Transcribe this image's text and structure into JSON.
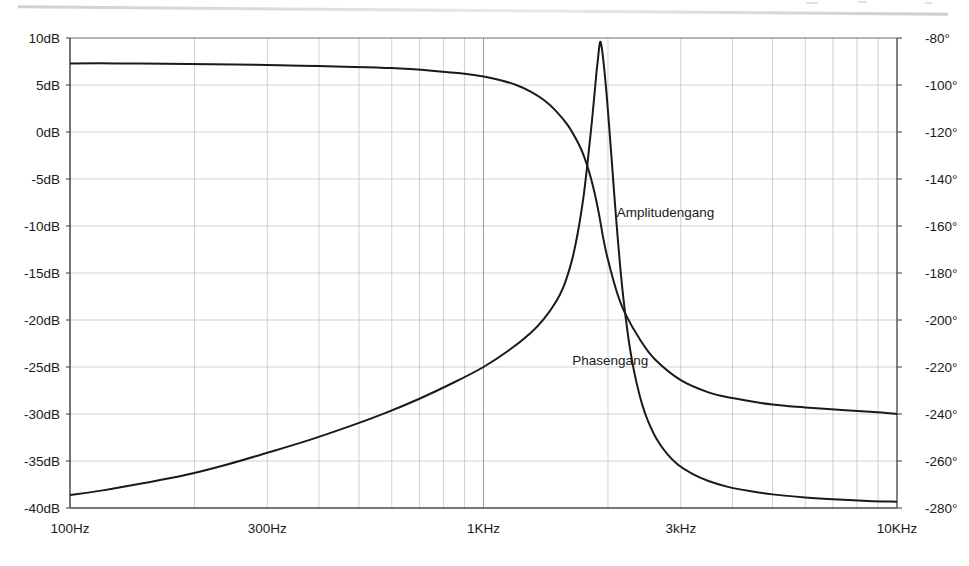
{
  "figure": {
    "title": "",
    "background": "#ffffff",
    "ink_color": "#1a1a1a",
    "grid_color": "#8f9bb0",
    "axis_color": "#4a4a4a"
  },
  "chart_data": {
    "type": "line",
    "title": "",
    "xlabel": "",
    "ylabel": "",
    "xscale": "log",
    "grid": true,
    "legend_position": "inline-annotation",
    "xlim": [
      100,
      10000
    ],
    "xtick_labels": [
      "100Hz",
      "300Hz",
      "1KHz",
      "3kHz",
      "10KHz"
    ],
    "xtick_values": [
      100,
      300,
      1000,
      3000,
      10000
    ],
    "axes": [
      {
        "id": "left",
        "label": "",
        "unit": "dB",
        "lim": [
          -40,
          10
        ],
        "step": 5,
        "tick_labels": [
          "10dB",
          "5dB",
          "0dB",
          "-5dB",
          "-10dB",
          "-15dB",
          "-20dB",
          "-25dB",
          "-30dB",
          "-35dB",
          "-40dB"
        ],
        "tick_values": [
          10,
          5,
          0,
          -5,
          -10,
          -15,
          -20,
          -25,
          -30,
          -35,
          -40
        ]
      },
      {
        "id": "right",
        "label": "",
        "unit": "deg",
        "lim": [
          -280,
          -80
        ],
        "step": 20,
        "tick_labels": [
          "-80°",
          "-100°",
          "-120°",
          "-140°",
          "-160°",
          "-180°",
          "-200°",
          "-220°",
          "-240°",
          "-260°",
          "-280°"
        ],
        "tick_values": [
          -80,
          -100,
          -120,
          -140,
          -160,
          -180,
          -200,
          -220,
          -240,
          -260,
          -280
        ]
      }
    ],
    "series": [
      {
        "name": "Amplitudengang",
        "axis": "left",
        "unit": "dB",
        "annotation": "Amplitudengang",
        "annotation_at": [
          2100,
          -9
        ],
        "points": [
          [
            100,
            7.3
          ],
          [
            130,
            7.3
          ],
          [
            170,
            7.25
          ],
          [
            220,
            7.2
          ],
          [
            280,
            7.15
          ],
          [
            360,
            7.05
          ],
          [
            460,
            6.95
          ],
          [
            600,
            6.8
          ],
          [
            760,
            6.5
          ],
          [
            900,
            6.2
          ],
          [
            1000,
            5.9
          ],
          [
            1100,
            5.5
          ],
          [
            1200,
            5.0
          ],
          [
            1300,
            4.3
          ],
          [
            1400,
            3.4
          ],
          [
            1500,
            2.2
          ],
          [
            1600,
            0.7
          ],
          [
            1700,
            -1.3
          ],
          [
            1750,
            -2.6
          ],
          [
            1800,
            -4.2
          ],
          [
            1850,
            -6.2
          ],
          [
            1900,
            -8.6
          ],
          [
            1950,
            -11.4
          ],
          [
            2000,
            -13.6
          ],
          [
            2100,
            -17.0
          ],
          [
            2200,
            -19.3
          ],
          [
            2400,
            -22.2
          ],
          [
            2600,
            -24.2
          ],
          [
            3000,
            -26.4
          ],
          [
            3500,
            -27.7
          ],
          [
            4000,
            -28.3
          ],
          [
            5000,
            -29.0
          ],
          [
            6000,
            -29.3
          ],
          [
            7500,
            -29.6
          ],
          [
            8800,
            -29.8
          ],
          [
            10000,
            -30.0
          ]
        ]
      },
      {
        "name": "Phasengang",
        "axis": "right",
        "unit": "deg",
        "annotation": "Phasengang",
        "annotation_at": [
          1640,
          -219
        ],
        "points": [
          [
            100,
            -274.5
          ],
          [
            120,
            -272.5
          ],
          [
            150,
            -269.5
          ],
          [
            190,
            -266.0
          ],
          [
            240,
            -261.5
          ],
          [
            300,
            -256.5
          ],
          [
            380,
            -251.0
          ],
          [
            470,
            -245.5
          ],
          [
            580,
            -239.5
          ],
          [
            700,
            -233.5
          ],
          [
            850,
            -226.5
          ],
          [
            1000,
            -220.0
          ],
          [
            1150,
            -213.0
          ],
          [
            1300,
            -205.5
          ],
          [
            1400,
            -199.5
          ],
          [
            1500,
            -192.0
          ],
          [
            1560,
            -186.0
          ],
          [
            1610,
            -179.0
          ],
          [
            1650,
            -172.0
          ],
          [
            1690,
            -163.0
          ],
          [
            1720,
            -155.0
          ],
          [
            1750,
            -146.0
          ],
          [
            1780,
            -135.0
          ],
          [
            1800,
            -127.0
          ],
          [
            1830,
            -115.0
          ],
          [
            1855,
            -104.0
          ],
          [
            1875,
            -95.0
          ],
          [
            1890,
            -89.5
          ],
          [
            1900,
            -85.5
          ],
          [
            1908,
            -83.0
          ],
          [
            1915,
            -81.6
          ],
          [
            1925,
            -82.5
          ],
          [
            1940,
            -86.5
          ],
          [
            1960,
            -93.5
          ],
          [
            1985,
            -104.0
          ],
          [
            2010,
            -116.0
          ],
          [
            2040,
            -131.0
          ],
          [
            2070,
            -146.0
          ],
          [
            2100,
            -160.0
          ],
          [
            2140,
            -177.0
          ],
          [
            2180,
            -191.0
          ],
          [
            2230,
            -205.0
          ],
          [
            2280,
            -216.0
          ],
          [
            2340,
            -226.0
          ],
          [
            2420,
            -236.0
          ],
          [
            2500,
            -243.0
          ],
          [
            2620,
            -250.5
          ],
          [
            2780,
            -257.0
          ],
          [
            2950,
            -261.5
          ],
          [
            3200,
            -265.5
          ],
          [
            3500,
            -268.5
          ],
          [
            3900,
            -271.0
          ],
          [
            4400,
            -272.8
          ],
          [
            5000,
            -274.2
          ],
          [
            6000,
            -275.5
          ],
          [
            7200,
            -276.4
          ],
          [
            8500,
            -277.0
          ],
          [
            10000,
            -277.3
          ]
        ]
      }
    ],
    "notes": {
      "resonance_peak_amplitude_db": 8.5,
      "resonance_peak_freq_hz": 1915,
      "amplitude_lowfreq_plateau_db": 7.3,
      "phase_lowfreq_deg": -274.5,
      "phase_highfreq_deg": -277.3
    }
  }
}
